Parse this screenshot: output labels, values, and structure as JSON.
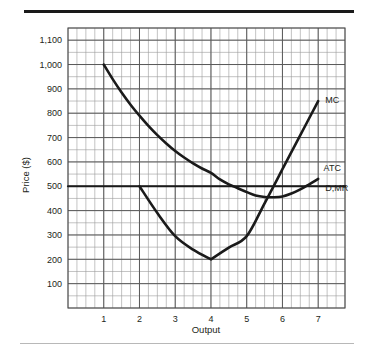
{
  "figure": {
    "background_color": "#ffffff",
    "top_rule_color": "#1a1a1a",
    "bottom_rule_color": "#b8b8b8"
  },
  "chart_data": {
    "type": "line",
    "title": "",
    "xlabel": "Output",
    "ylabel": "Price ($)",
    "xlim": [
      0,
      7.75
    ],
    "ylim": [
      0,
      1150
    ],
    "grid": true,
    "grid_major_color": "#5a5a5a",
    "grid_minor_color": "#9a9a9a",
    "curve_color": "#1a1a1a",
    "legend_position": "inline-right",
    "xticks": [
      1,
      2,
      3,
      4,
      5,
      6,
      7
    ],
    "xtick_labels": [
      "1",
      "2",
      "3",
      "4",
      "5",
      "6",
      "7"
    ],
    "yticks": [
      100,
      200,
      300,
      400,
      500,
      600,
      700,
      800,
      900,
      1000,
      1100
    ],
    "ytick_labels": [
      "100",
      "200",
      "300",
      "400",
      "500",
      "600",
      "700",
      "800",
      "900",
      "1,000",
      "1,100"
    ],
    "y_minor_step": 50,
    "x_minor_step": 0.25,
    "series": [
      {
        "name": "ATC",
        "label": "ATC",
        "type": "curve",
        "x": [
          1.0,
          1.25,
          1.5,
          1.75,
          2.0,
          2.25,
          2.5,
          2.75,
          3.0,
          3.25,
          3.5,
          3.75,
          4.0,
          4.25,
          4.5,
          4.75,
          5.0,
          5.25,
          5.5,
          5.75,
          6.0,
          6.25,
          6.5,
          6.75,
          7.0
        ],
        "values": [
          1000,
          940,
          885,
          835,
          790,
          748,
          710,
          676,
          645,
          618,
          594,
          573,
          555,
          528,
          508,
          492,
          476,
          462,
          456,
          455,
          458,
          470,
          487,
          508,
          530
        ]
      },
      {
        "name": "MC",
        "label": "MC",
        "type": "curve",
        "x": [
          2.0,
          2.5,
          3.0,
          3.5,
          4.0,
          4.5,
          5.0,
          5.5,
          6.0,
          6.5,
          7.0
        ],
        "values": [
          500,
          390,
          295,
          240,
          200,
          248,
          295,
          430,
          570,
          710,
          850
        ]
      },
      {
        "name": "D,MR",
        "label": "D,MR",
        "type": "horizontal-line",
        "x": [
          0.0,
          7.75
        ],
        "values": [
          500,
          500
        ]
      }
    ],
    "annotations": [
      {
        "text": "MC",
        "x": 7.2,
        "y": 855
      },
      {
        "text": "ATC",
        "x": 7.15,
        "y": 575
      },
      {
        "text": "D,MR",
        "x": 7.2,
        "y": 495
      }
    ]
  }
}
